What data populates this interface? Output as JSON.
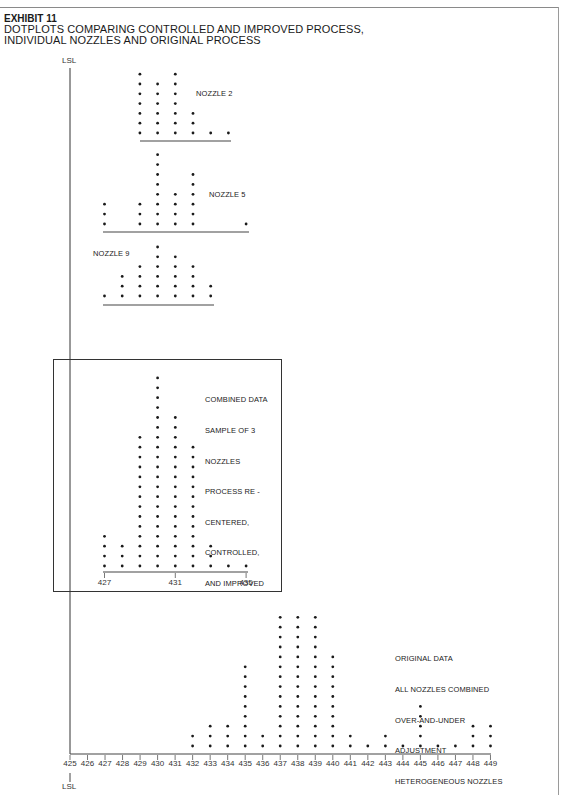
{
  "header": {
    "exhibit": "EXHIBIT 11",
    "title_line1": "DOTPLOTS COMPARING CONTROLLED AND IMPROVED PROCESS,",
    "title_line2": "INDIVIDUAL NOZZLES AND ORIGINAL PROCESS"
  },
  "lsl": {
    "top_label": "LSL",
    "bottom_label": "LSL"
  },
  "panels": {
    "nozzle2": {
      "label": "NOZZLE 2"
    },
    "nozzle5": {
      "label": "NOZZLE 5"
    },
    "nozzle9": {
      "label": "NOZZLE 9"
    },
    "combined": {
      "label_lines": [
        "COMBINED DATA",
        "SAMPLE OF 3",
        "NOZZLES",
        "PROCESS RE -",
        "CENTERED,",
        "CONTROLLED,",
        "AND IMPROVED"
      ],
      "ticks": [
        "427",
        "431",
        "435"
      ]
    },
    "original": {
      "label_lines": [
        "ORIGINAL DATA",
        "ALL NOZZLES COMBINED",
        "OVER-AND-UNDER",
        "ADJUSTMENT",
        "HETEROGENEOUS NOZZLES"
      ],
      "ticks": [
        "425",
        "426",
        "427",
        "428",
        "429",
        "430",
        "431",
        "432",
        "433",
        "434",
        "435",
        "436",
        "437",
        "438",
        "439",
        "440",
        "441",
        "442",
        "443",
        "444",
        "445",
        "446",
        "447",
        "448",
        "449"
      ]
    }
  },
  "chart_data": [
    {
      "type": "dotplot",
      "title": "NOZZLE 2",
      "x": [
        429,
        430,
        431,
        432,
        433,
        434
      ],
      "counts": [
        7,
        6,
        7,
        3,
        1,
        1
      ]
    },
    {
      "type": "dotplot",
      "title": "NOZZLE 5",
      "x": [
        427,
        429,
        430,
        431,
        432,
        435
      ],
      "counts": [
        3,
        3,
        8,
        4,
        6,
        1
      ]
    },
    {
      "type": "dotplot",
      "title": "NOZZLE 9",
      "x": [
        427,
        428,
        429,
        430,
        431,
        432,
        433
      ],
      "counts": [
        1,
        3,
        4,
        6,
        5,
        4,
        2
      ]
    },
    {
      "type": "dotplot",
      "title": "COMBINED DATA SAMPLE OF 3 NOZZLES PROCESS RE-CENTERED, CONTROLLED, AND IMPROVED",
      "x": [
        427,
        428,
        429,
        430,
        431,
        432,
        433,
        434,
        435
      ],
      "counts": [
        4,
        3,
        14,
        20,
        16,
        13,
        3,
        1,
        1
      ],
      "xticks": [
        427,
        431,
        435
      ],
      "xlim": [
        427,
        435
      ]
    },
    {
      "type": "dotplot",
      "title": "ORIGINAL DATA ALL NOZZLES COMBINED OVER-AND-UNDER ADJUSTMENT HETEROGENEOUS NOZZLES",
      "x": [
        432,
        433,
        434,
        435,
        436,
        437,
        438,
        439,
        440,
        441,
        442,
        443,
        444,
        445,
        446,
        447,
        448,
        449
      ],
      "counts": [
        2,
        3,
        3,
        9,
        2,
        14,
        14,
        14,
        10,
        2,
        1,
        2,
        1,
        5,
        1,
        1,
        3,
        3
      ],
      "xticks": [
        425,
        426,
        427,
        428,
        429,
        430,
        431,
        432,
        433,
        434,
        435,
        436,
        437,
        438,
        439,
        440,
        441,
        442,
        443,
        444,
        445,
        446,
        447,
        448,
        449
      ],
      "xlim": [
        425,
        449
      ],
      "reference_line": {
        "label": "LSL",
        "x": 425
      }
    }
  ]
}
